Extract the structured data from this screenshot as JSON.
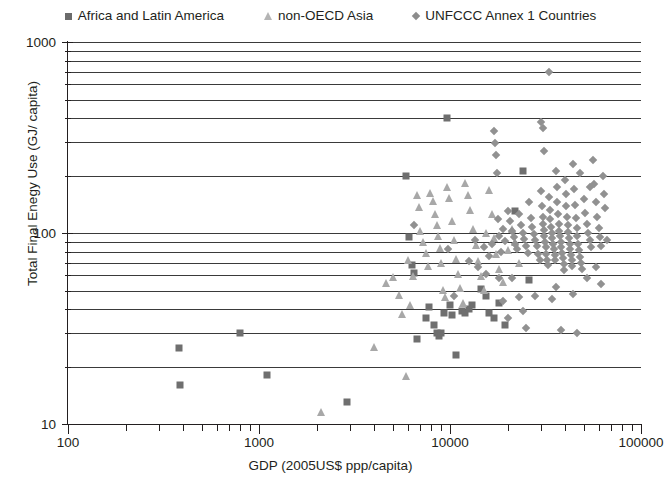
{
  "legend": {
    "position": "top-center",
    "entries": [
      {
        "label": "Africa and Latin America",
        "marker": "square-icon",
        "color": "#6b6b6b"
      },
      {
        "label": "non-OECD Asia",
        "marker": "triangle-icon",
        "color": "#b4b4b4"
      },
      {
        "label": "UNFCCC Annex 1 Countries",
        "marker": "diamond-icon",
        "color": "#8c8c8c"
      }
    ]
  },
  "axes": {
    "x_title": "GDP  (2005US$ ppp/capita)",
    "y_title": "Total Final Enegy Use  (GJ/ capita)",
    "x_ticks": [
      "100",
      "1000",
      "10000",
      "100000"
    ],
    "y_ticks": [
      "1000",
      "100",
      "10"
    ]
  },
  "chart_data": {
    "type": "scatter",
    "title": "",
    "subtitle": "",
    "xlabel": "GDP  (2005US$ ppp/capita)",
    "ylabel": "Total Final Enegy Use  (GJ/ capita)",
    "xscale": "log",
    "yscale": "log",
    "xlim": [
      100,
      100000
    ],
    "ylim": [
      10,
      1000
    ],
    "xticks": [
      100,
      1000,
      10000,
      100000
    ],
    "yticks": [
      10,
      100,
      1000
    ],
    "grid": "horizontal-minor-log",
    "legend_position": "top-center",
    "series": [
      {
        "name": "Africa and Latin America",
        "marker": "square",
        "color": "#6f6f6f",
        "size": 7,
        "points": [
          [
            380,
            25
          ],
          [
            385,
            16
          ],
          [
            800,
            30
          ],
          [
            1100,
            18
          ],
          [
            2900,
            13
          ],
          [
            5900,
            200
          ],
          [
            6100,
            95
          ],
          [
            6300,
            68
          ],
          [
            6500,
            62
          ],
          [
            6700,
            28
          ],
          [
            7500,
            36
          ],
          [
            7800,
            41
          ],
          [
            8200,
            33
          ],
          [
            8600,
            30
          ],
          [
            8800,
            29
          ],
          [
            9000,
            30
          ],
          [
            9300,
            38
          ],
          [
            9700,
            400
          ],
          [
            10000,
            42
          ],
          [
            10300,
            37
          ],
          [
            10800,
            23
          ],
          [
            11500,
            39
          ],
          [
            12000,
            38
          ],
          [
            12500,
            40
          ],
          [
            13000,
            42
          ],
          [
            14500,
            51
          ],
          [
            15500,
            47
          ],
          [
            16000,
            38
          ],
          [
            17000,
            36
          ],
          [
            18000,
            43
          ],
          [
            19500,
            33
          ],
          [
            22000,
            130
          ],
          [
            24000,
            210
          ],
          [
            26000,
            57
          ]
        ]
      },
      {
        "name": "non-OECD Asia",
        "marker": "triangle",
        "color": "#a8a8a8",
        "size": 8,
        "points": [
          [
            2100,
            11
          ],
          [
            4000,
            24
          ],
          [
            4600,
            52
          ],
          [
            5000,
            56
          ],
          [
            5400,
            45
          ],
          [
            5600,
            36
          ],
          [
            5900,
            17
          ],
          [
            6000,
            69
          ],
          [
            6200,
            40
          ],
          [
            6400,
            57
          ],
          [
            6700,
            150
          ],
          [
            6900,
            130
          ],
          [
            7000,
            98
          ],
          [
            7200,
            86
          ],
          [
            7500,
            75
          ],
          [
            7700,
            64
          ],
          [
            7900,
            155
          ],
          [
            8100,
            140
          ],
          [
            8300,
            120
          ],
          [
            8500,
            105
          ],
          [
            8700,
            92
          ],
          [
            8900,
            80
          ],
          [
            9000,
            66
          ],
          [
            9200,
            48
          ],
          [
            9400,
            44
          ],
          [
            9700,
            165
          ],
          [
            9900,
            145
          ],
          [
            10200,
            110
          ],
          [
            10500,
            88
          ],
          [
            10800,
            70
          ],
          [
            11000,
            58
          ],
          [
            11300,
            49
          ],
          [
            11700,
            41
          ],
          [
            12000,
            175
          ],
          [
            12400,
            150
          ],
          [
            12800,
            125
          ],
          [
            13200,
            100
          ],
          [
            13600,
            82
          ],
          [
            14000,
            68
          ],
          [
            14500,
            57
          ],
          [
            15000,
            48
          ],
          [
            15500,
            95
          ],
          [
            16000,
            160
          ],
          [
            16500,
            120
          ],
          [
            17000,
            90
          ],
          [
            17500,
            74
          ],
          [
            18000,
            62
          ],
          [
            19000,
            53
          ],
          [
            20000,
            78
          ],
          [
            21000,
            100
          ],
          [
            22000,
            86
          ],
          [
            23000,
            66
          ]
        ]
      },
      {
        "name": "UNFCCC Annex 1 Countries",
        "marker": "diamond",
        "color": "#919191",
        "size": 6,
        "points": [
          [
            6500,
            110
          ],
          [
            9800,
            82
          ],
          [
            10500,
            47
          ],
          [
            12500,
            71
          ],
          [
            13500,
            92
          ],
          [
            14000,
            66
          ],
          [
            15000,
            84
          ],
          [
            15500,
            61
          ],
          [
            16000,
            76
          ],
          [
            16500,
            88
          ],
          [
            17000,
            340
          ],
          [
            17200,
            295
          ],
          [
            17400,
            255
          ],
          [
            17600,
            205
          ],
          [
            17800,
            118
          ],
          [
            18000,
            96
          ],
          [
            18500,
            80
          ],
          [
            19000,
            105
          ],
          [
            19500,
            91
          ],
          [
            20000,
            130
          ],
          [
            20500,
            115
          ],
          [
            21000,
            102
          ],
          [
            21500,
            95
          ],
          [
            22000,
            88
          ],
          [
            22500,
            82
          ],
          [
            23000,
            125
          ],
          [
            23500,
            110
          ],
          [
            24000,
            100
          ],
          [
            24500,
            93
          ],
          [
            25000,
            86
          ],
          [
            25500,
            79
          ],
          [
            26000,
            145
          ],
          [
            26500,
            120
          ],
          [
            27000,
            108
          ],
          [
            27500,
            99
          ],
          [
            28000,
            92
          ],
          [
            28500,
            85
          ],
          [
            29000,
            78
          ],
          [
            29500,
            72
          ],
          [
            30000,
            165
          ],
          [
            30200,
            138
          ],
          [
            30500,
            122
          ],
          [
            30800,
            112
          ],
          [
            31000,
            104
          ],
          [
            31200,
            97
          ],
          [
            31500,
            90
          ],
          [
            31800,
            84
          ],
          [
            32000,
            78
          ],
          [
            32300,
            72
          ],
          [
            32600,
            68
          ],
          [
            33000,
            155
          ],
          [
            33200,
            132
          ],
          [
            33500,
            118
          ],
          [
            33800,
            108
          ],
          [
            34000,
            100
          ],
          [
            34300,
            94
          ],
          [
            34600,
            88
          ],
          [
            35000,
            82
          ],
          [
            35300,
            77
          ],
          [
            35600,
            72
          ],
          [
            36000,
            210
          ],
          [
            36200,
            175
          ],
          [
            36500,
            145
          ],
          [
            36800,
            125
          ],
          [
            37000,
            112
          ],
          [
            37300,
            103
          ],
          [
            37600,
            96
          ],
          [
            38000,
            90
          ],
          [
            38300,
            84
          ],
          [
            38600,
            79
          ],
          [
            39000,
            74
          ],
          [
            39300,
            69
          ],
          [
            39600,
            64
          ],
          [
            40000,
            190
          ],
          [
            40300,
            160
          ],
          [
            40600,
            138
          ],
          [
            41000,
            122
          ],
          [
            41300,
            110
          ],
          [
            41600,
            101
          ],
          [
            42000,
            94
          ],
          [
            42300,
            88
          ],
          [
            42600,
            82
          ],
          [
            43000,
            77
          ],
          [
            43300,
            72
          ],
          [
            43600,
            67
          ],
          [
            44000,
            230
          ],
          [
            44500,
            170
          ],
          [
            45000,
            140
          ],
          [
            45500,
            120
          ],
          [
            46000,
            106
          ],
          [
            46500,
            96
          ],
          [
            47000,
            88
          ],
          [
            47500,
            81
          ],
          [
            48000,
            75
          ],
          [
            48500,
            70
          ],
          [
            49000,
            65
          ],
          [
            50000,
            150
          ],
          [
            51000,
            128
          ],
          [
            52000,
            112
          ],
          [
            53000,
            100
          ],
          [
            54000,
            92
          ],
          [
            55000,
            84
          ],
          [
            56000,
            240
          ],
          [
            57000,
            180
          ],
          [
            58000,
            145
          ],
          [
            59000,
            122
          ],
          [
            60000,
            106
          ],
          [
            61000,
            95
          ],
          [
            62000,
            86
          ],
          [
            63000,
            200
          ],
          [
            64000,
            160
          ],
          [
            65000,
            135
          ],
          [
            23000,
            46
          ],
          [
            28000,
            47
          ],
          [
            34000,
            45
          ],
          [
            44000,
            48
          ],
          [
            30000,
            380
          ],
          [
            30500,
            355
          ],
          [
            31000,
            270
          ],
          [
            33000,
            700
          ],
          [
            25000,
            32
          ],
          [
            38000,
            31
          ],
          [
            46000,
            30
          ],
          [
            20000,
            36
          ],
          [
            21000,
            58
          ],
          [
            18000,
            58
          ],
          [
            19000,
            44
          ],
          [
            24000,
            39
          ],
          [
            36000,
            52
          ],
          [
            52000,
            58
          ],
          [
            58000,
            66
          ],
          [
            62000,
            54
          ],
          [
            66000,
            92
          ],
          [
            54000,
            175
          ],
          [
            48000,
            205
          ]
        ]
      }
    ]
  }
}
